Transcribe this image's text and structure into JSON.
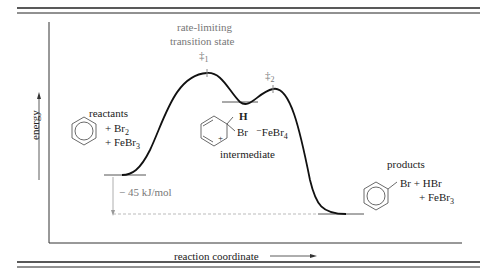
{
  "diagram": {
    "type": "reaction-energy-profile",
    "axes": {
      "y_label": "energy",
      "x_label": "reaction coordinate"
    },
    "labels": {
      "ts1_title_line1": "rate-limiting",
      "ts1_title_line2": "transition state",
      "ts1_symbol": "‡",
      "ts1_sub": "1",
      "ts2_symbol": "‡",
      "ts2_sub": "2",
      "reactants": "reactants",
      "reactants_plus_br2": "+ Br",
      "reactants_br2_sub": "2",
      "reactants_plus_febr3": "+ FeBr",
      "reactants_febr3_sub": "3",
      "intermediate": "intermediate",
      "intermediate_h": "H",
      "intermediate_br": "Br",
      "intermediate_plus": "+",
      "intermediate_counterion": "⁻FeBr",
      "intermediate_counterion_sub": "4",
      "products": "products",
      "products_line1": "Br + HBr",
      "products_line2": "+ FeBr",
      "products_febr3_sub": "3",
      "delta_energy": "− 45 kJ/mol"
    },
    "colors": {
      "curve": "#111111",
      "annotation_gray": "#888888",
      "frame": "#222222"
    }
  }
}
